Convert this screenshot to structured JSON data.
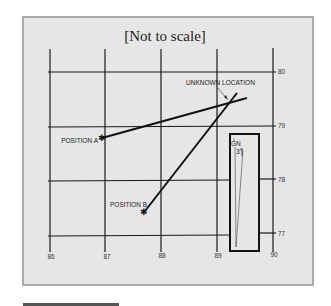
{
  "diagram": {
    "title": "[Not to scale]",
    "x_ticks": [
      "86",
      "87",
      "88",
      "89",
      "90"
    ],
    "y_ticks": [
      "80",
      "79",
      "78",
      "77"
    ],
    "points": {
      "position_a": {
        "label": "POSITION A",
        "x": 87.0,
        "y": 78.8
      },
      "position_b": {
        "label": "POSITION B",
        "x": 87.7,
        "y": 77.4
      },
      "unknown_location": {
        "label": "UNKNOWN LOCATION",
        "x": 89.2,
        "y": 79.5
      }
    },
    "inset": {
      "north_label": "GN",
      "angle_label": "3°"
    },
    "colors": {
      "panel_bg": "#e6e6e6",
      "panel_border": "#a9a9a9",
      "line": "#111111"
    }
  }
}
